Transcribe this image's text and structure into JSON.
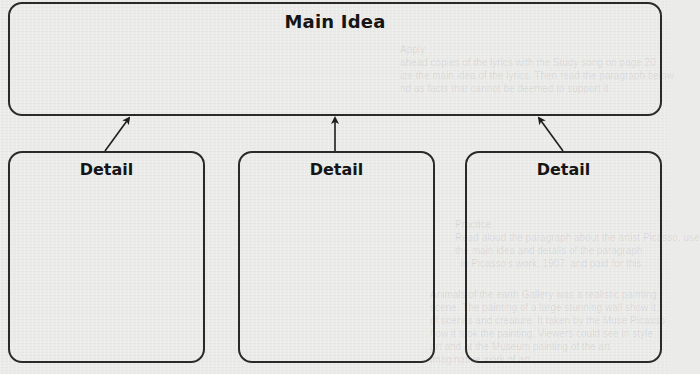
{
  "diagram": {
    "type": "main-idea-and-details graphic organizer",
    "main_box": {
      "title": "Main Idea"
    },
    "detail_boxes": [
      {
        "title": "Detail"
      },
      {
        "title": "Detail"
      },
      {
        "title": "Detail"
      }
    ],
    "connectors": [
      {
        "from": "detail_boxes.0",
        "to": "main_box",
        "style": "arrow"
      },
      {
        "from": "detail_boxes.1",
        "to": "main_box",
        "style": "arrow"
      },
      {
        "from": "detail_boxes.2",
        "to": "main_box",
        "style": "arrow"
      }
    ],
    "colors": {
      "background": "#ebebea",
      "stroke": "#2a2a2a",
      "text": "#151515"
    }
  }
}
